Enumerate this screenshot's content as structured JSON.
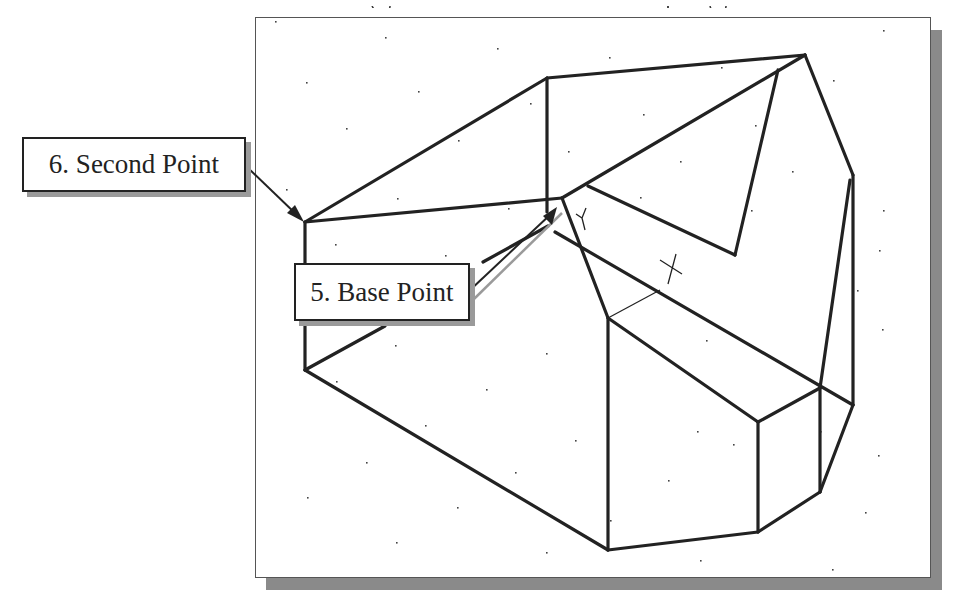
{
  "figure": {
    "caption_clipped": "g          p g",
    "colors": {
      "line": "#222222",
      "frame_border": "#555555",
      "shadow": "#8a8a8a",
      "callout_shadow": "#9a9a9a",
      "leader_highlight": "#9a9a9a",
      "background": "#ffffff"
    }
  },
  "callouts": [
    {
      "id": "second-point",
      "label": "6. Second Point",
      "target": [
        305,
        222
      ]
    },
    {
      "id": "base-point",
      "label": "5. Base Point",
      "target": [
        557,
        222
      ]
    }
  ],
  "drawing": {
    "frame": {
      "x": 255,
      "y": 17,
      "width": 674,
      "height": 559
    },
    "edges": [
      [
        305,
        222,
        547,
        78
      ],
      [
        547,
        78,
        805,
        55
      ],
      [
        547,
        78,
        547,
        212
      ],
      [
        305,
        222,
        562,
        198
      ],
      [
        562,
        198,
        805,
        55
      ],
      [
        588,
        186,
        735,
        255
      ],
      [
        735,
        255,
        778,
        70
      ],
      [
        805,
        55,
        853,
        175
      ],
      [
        853,
        175,
        853,
        405
      ],
      [
        850,
        180,
        820,
        388
      ],
      [
        305,
        222,
        305,
        370
      ],
      [
        562,
        198,
        608,
        318
      ],
      [
        555,
        232,
        853,
        405
      ],
      [
        608,
        318,
        758,
        422
      ],
      [
        758,
        422,
        820,
        388
      ],
      [
        608,
        318,
        608,
        550
      ],
      [
        758,
        422,
        758,
        532
      ],
      [
        820,
        388,
        820,
        492
      ],
      [
        305,
        370,
        608,
        550
      ],
      [
        608,
        550,
        758,
        532
      ],
      [
        758,
        532,
        820,
        492
      ],
      [
        820,
        492,
        853,
        405
      ],
      [
        305,
        370,
        385,
        326
      ],
      [
        483,
        262,
        548,
        226
      ]
    ],
    "thin_edges": [
      [
        608,
        318,
        660,
        290
      ]
    ],
    "cursors": [
      {
        "type": "ucs-y",
        "x": 582,
        "y": 218
      },
      {
        "type": "crosshair",
        "x": 672,
        "y": 268
      }
    ],
    "grid_dots": [
      [
        275,
        21
      ],
      [
        385,
        37
      ],
      [
        497,
        48
      ],
      [
        609,
        57
      ],
      [
        721,
        67
      ],
      [
        833,
        80
      ],
      [
        306,
        82
      ],
      [
        418,
        91
      ],
      [
        530,
        103
      ],
      [
        643,
        114
      ],
      [
        755,
        125
      ],
      [
        883,
        30
      ],
      [
        346,
        128
      ],
      [
        458,
        140
      ],
      [
        568,
        151
      ],
      [
        680,
        161
      ],
      [
        792,
        171
      ],
      [
        286,
        189
      ],
      [
        397,
        198
      ],
      [
        508,
        208
      ],
      [
        640,
        197
      ],
      [
        751,
        210
      ],
      [
        883,
        210
      ],
      [
        335,
        244
      ],
      [
        445,
        255
      ],
      [
        857,
        290
      ],
      [
        395,
        345
      ],
      [
        546,
        353
      ],
      [
        706,
        340
      ],
      [
        879,
        250
      ],
      [
        336,
        381
      ],
      [
        486,
        389
      ],
      [
        697,
        431
      ],
      [
        820,
        431
      ],
      [
        425,
        425
      ],
      [
        575,
        440
      ],
      [
        733,
        444
      ],
      [
        882,
        329
      ],
      [
        366,
        462
      ],
      [
        515,
        472
      ],
      [
        668,
        480
      ],
      [
        878,
        455
      ],
      [
        307,
        497
      ],
      [
        457,
        507
      ],
      [
        610,
        520
      ],
      [
        865,
        512
      ],
      [
        396,
        542
      ],
      [
        546,
        552
      ],
      [
        700,
        560
      ],
      [
        832,
        569
      ]
    ]
  }
}
